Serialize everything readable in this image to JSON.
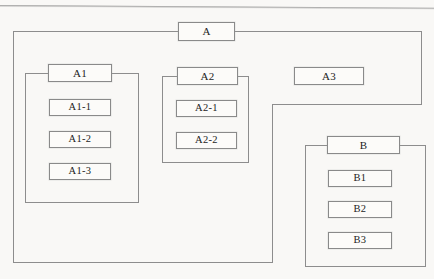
{
  "diagram": {
    "type": "hierarchy-block-diagram",
    "title": "",
    "background_color": "#f9f8f6",
    "line_color": "#8d8d8d",
    "box_fill_color": "#fcfbf9",
    "box_border_color": "#8a8a8a",
    "nodes": {
      "a": "A",
      "a1": "A1",
      "a1_1": "A1-1",
      "a1_2": "A1-2",
      "a1_3": "A1-3",
      "a2": "A2",
      "a2_1": "A2-1",
      "a2_2": "A2-2",
      "a3": "A3",
      "b": "B",
      "b1": "B1",
      "b2": "B2",
      "b3": "B3"
    },
    "structure": [
      {
        "label": "A",
        "children": [
          {
            "label": "A1",
            "children": [
              {
                "label": "A1-1",
                "children": []
              },
              {
                "label": "A1-2",
                "children": []
              },
              {
                "label": "A1-3",
                "children": []
              }
            ]
          },
          {
            "label": "A2",
            "children": [
              {
                "label": "A2-1",
                "children": []
              },
              {
                "label": "A2-2",
                "children": []
              }
            ]
          },
          {
            "label": "A3",
            "children": []
          }
        ]
      },
      {
        "label": "B",
        "children": [
          {
            "label": "B1",
            "children": []
          },
          {
            "label": "B2",
            "children": []
          },
          {
            "label": "B3",
            "children": []
          }
        ]
      }
    ]
  }
}
